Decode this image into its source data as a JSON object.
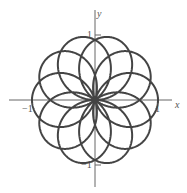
{
  "chart_data": {
    "type": "line",
    "subtype": "polar",
    "title": "",
    "equation": "r = cos(5θ/4)",
    "params": {
      "k_num": 5,
      "k_den": 4,
      "theta_start": 0,
      "theta_end_multiple_of_pi": 8
    },
    "petal_tip_angles_deg": [
      0,
      36,
      72,
      108,
      144,
      180,
      216,
      252,
      288,
      324
    ],
    "xlabel": "x",
    "ylabel": "y",
    "xlim": [
      -1.3,
      1.2
    ],
    "ylim": [
      -1.3,
      1.4
    ],
    "x_ticks": [
      {
        "value": -1,
        "label": "−1"
      },
      {
        "value": 1,
        "label": "1"
      }
    ],
    "y_ticks": [
      {
        "value": 1,
        "label": "1"
      },
      {
        "value": -1,
        "label": "−1"
      }
    ],
    "grid": false,
    "legend": null,
    "line_color": "#444444",
    "axis_color": "#666666"
  }
}
